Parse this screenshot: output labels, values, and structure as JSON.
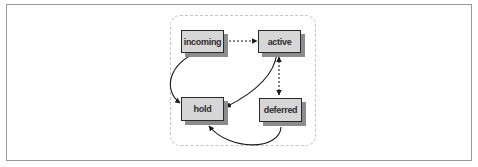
{
  "diagram": {
    "type": "state-diagram",
    "nodes": [
      {
        "id": "incoming",
        "label": "incoming"
      },
      {
        "id": "active",
        "label": "active"
      },
      {
        "id": "hold",
        "label": "hold"
      },
      {
        "id": "deferred",
        "label": "deferred"
      }
    ],
    "edges": [
      {
        "from": "incoming",
        "to": "active",
        "style": "dotted",
        "direction": "forward"
      },
      {
        "from": "incoming",
        "to": "hold",
        "style": "solid",
        "direction": "forward"
      },
      {
        "from": "active",
        "to": "hold",
        "style": "solid",
        "direction": "forward"
      },
      {
        "from": "active",
        "to": "deferred",
        "style": "dotted",
        "direction": "both"
      },
      {
        "from": "deferred",
        "to": "hold",
        "style": "solid",
        "direction": "forward"
      }
    ],
    "colors": {
      "node_fill": "#d6d6d6",
      "node_border": "#2a2a2a",
      "node_shadow": "#8c8c8c",
      "edge": "#1a1a1a",
      "region_border": "#c4c4c4",
      "frame_border": "#9a9a9a"
    }
  }
}
